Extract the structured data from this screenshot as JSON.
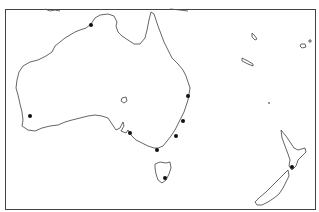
{
  "map": {
    "region": "Australia and New Zealand",
    "width": 319,
    "height": 212,
    "frame": {
      "x": 5.5,
      "y": 9.5,
      "w": 310,
      "h": 200
    },
    "colors": {
      "land_fill": "#ffffff",
      "coastline": "#555555",
      "marker": "#111111",
      "frame": "#444444"
    },
    "markers": [
      {
        "name": "Darwin",
        "x": 91,
        "y": 25
      },
      {
        "name": "Brisbane",
        "x": 188,
        "y": 96
      },
      {
        "name": "Port Macquarie",
        "x": 183,
        "y": 121
      },
      {
        "name": "Sydney",
        "x": 176,
        "y": 136
      },
      {
        "name": "Perth",
        "x": 30,
        "y": 116
      },
      {
        "name": "Adelaide",
        "x": 130,
        "y": 133
      },
      {
        "name": "Melbourne",
        "x": 157,
        "y": 150
      },
      {
        "name": "Hobart",
        "x": 165,
        "y": 178
      },
      {
        "name": "Wellington",
        "x": 292,
        "y": 167
      }
    ]
  }
}
